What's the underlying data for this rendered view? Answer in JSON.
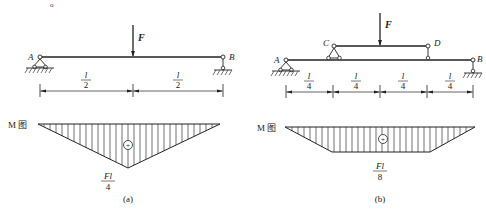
{
  "figure": {
    "top_stray_mark": "o",
    "diagrams": [
      {
        "id": "a",
        "caption": "(a)",
        "beam": {
          "nodes": [
            {
              "label": "A",
              "support": "pin"
            },
            {
              "label": "B",
              "support": "roller"
            }
          ]
        },
        "load": {
          "label": "F",
          "position": "midspan"
        },
        "dimensions": [
          {
            "num": "l",
            "den": "2"
          },
          {
            "num": "l",
            "den": "2"
          }
        ],
        "moment_diagram": {
          "title": "M 图",
          "shape": "triangle",
          "sign": "+",
          "peak_label": {
            "num": "Fl",
            "den": "4"
          }
        }
      },
      {
        "id": "b",
        "caption": "(b)",
        "beam": {
          "nodes": [
            {
              "label": "A",
              "support": "pin"
            },
            {
              "label": "C",
              "support": "secondary-beam-pin"
            },
            {
              "label": "D",
              "support": "secondary-beam-link"
            },
            {
              "label": "B",
              "support": "roller"
            }
          ]
        },
        "load": {
          "label": "F",
          "position": "midspan of CD"
        },
        "dimensions": [
          {
            "num": "l",
            "den": "4"
          },
          {
            "num": "l",
            "den": "4"
          },
          {
            "num": "l",
            "den": "4"
          },
          {
            "num": "l",
            "den": "4"
          }
        ],
        "moment_diagram": {
          "title": "M 图",
          "shape": "trapezoid",
          "sign": "+",
          "peak_label": {
            "num": "Fl",
            "den": "8"
          }
        }
      }
    ]
  }
}
